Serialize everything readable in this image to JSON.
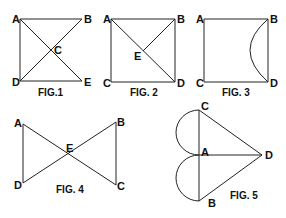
{
  "figures": [
    {
      "caption": "FIG.1",
      "labels": {
        "A": "A",
        "B": "B",
        "C": "C",
        "D": "D",
        "E": "E"
      }
    },
    {
      "caption": "FIG. 2",
      "labels": {
        "A": "A",
        "B": "B",
        "C": "C",
        "D": "D",
        "E": "E"
      }
    },
    {
      "caption": "FIG. 3",
      "labels": {
        "A": "A",
        "B": "B",
        "C": "C",
        "D": "D"
      }
    },
    {
      "caption": "FIG. 4",
      "labels": {
        "A": "A",
        "B": "B",
        "C": "C",
        "D": "D",
        "E": "E"
      }
    },
    {
      "caption": "FIG. 5",
      "labels": {
        "A": "A",
        "B": "B",
        "C": "C",
        "D": "D"
      }
    }
  ],
  "colors": {
    "line": "#222222",
    "background": "#ffffff"
  }
}
